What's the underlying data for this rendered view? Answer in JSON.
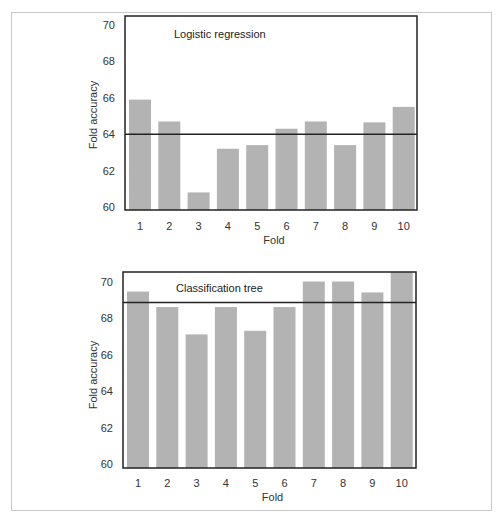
{
  "chart_data": [
    {
      "type": "bar",
      "title": "Logistic regression",
      "xlabel": "Fold",
      "ylabel": "Fold accuracy",
      "categories": [
        "1",
        "2",
        "3",
        "4",
        "5",
        "6",
        "7",
        "8",
        "9",
        "10"
      ],
      "values": [
        65.9,
        64.7,
        60.8,
        63.2,
        63.4,
        64.3,
        64.7,
        63.4,
        64.65,
        65.5
      ],
      "reference_line": 64.0,
      "ylim": [
        60,
        70
      ],
      "yticks": [
        60,
        62,
        64,
        66,
        68,
        70
      ],
      "grid": false,
      "bar_color": "#b3b3b3",
      "line_color": "#222222"
    },
    {
      "type": "bar",
      "title": "Classification tree",
      "xlabel": "Fold",
      "ylabel": "Fold accuracy",
      "categories": [
        "1",
        "2",
        "3",
        "4",
        "5",
        "6",
        "7",
        "8",
        "9",
        "10"
      ],
      "values": [
        69.45,
        68.6,
        67.1,
        68.6,
        67.3,
        68.6,
        70.0,
        70.0,
        69.4,
        70.5
      ],
      "reference_line": 68.85,
      "ylim": [
        60,
        70
      ],
      "yticks": [
        60,
        62,
        64,
        66,
        68,
        70
      ],
      "grid": false,
      "bar_color": "#b3b3b3",
      "line_color": "#222222"
    }
  ]
}
